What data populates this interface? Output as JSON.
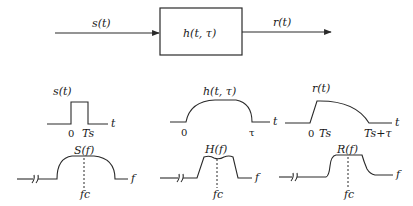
{
  "block_diagram": {
    "input_label": "s(t)",
    "system_label": "h(t, τ)",
    "output_label": "r(t)"
  },
  "panels": {
    "input": {
      "time_label": "s(t)",
      "time_axis": "t",
      "time_ticks": [
        "0",
        "Ts"
      ],
      "freq_label": "S(f)",
      "freq_axis": "f",
      "freq_center": "fc"
    },
    "channel": {
      "time_label": "h(t, τ)",
      "time_axis": "t",
      "time_ticks": [
        "0",
        "τ"
      ],
      "freq_label": "H(f)",
      "freq_axis": "f",
      "freq_center": "fc"
    },
    "output": {
      "time_label": "r(t)",
      "time_axis": "t",
      "time_ticks": [
        "0",
        "Ts",
        "Ts+τ"
      ],
      "freq_label": "R(f)",
      "freq_axis": "f",
      "freq_center": "fc"
    }
  },
  "colors": {
    "stroke": "#2a2a2a",
    "background": "#ffffff"
  }
}
